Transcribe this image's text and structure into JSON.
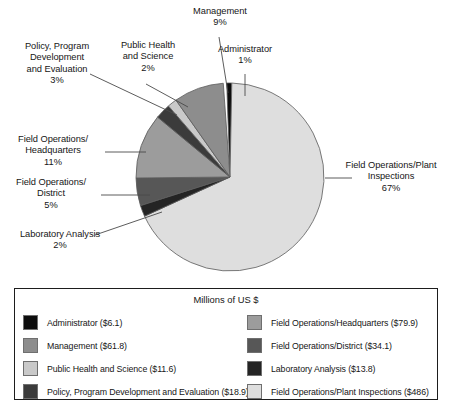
{
  "chart_data": {
    "type": "pie",
    "title": "",
    "legend_title": "Millions of US $",
    "legend_position": "bottom",
    "unit": "Millions of US $",
    "total_value": 716.2,
    "categories": [
      "Administrator",
      "Field Operations/Plant Inspections",
      "Laboratory Analysis",
      "Field Operations/District",
      "Field Operations/Headquarters",
      "Policy, Program Development and Evaluation",
      "Public Health and Science",
      "Management"
    ],
    "values": [
      6.1,
      486,
      13.8,
      34.1,
      79.9,
      18.9,
      11.6,
      61.8
    ],
    "percentages": [
      1,
      67,
      2,
      5,
      11,
      3,
      2,
      9
    ],
    "colors": [
      "#0d0d0d",
      "#dedede",
      "#242424",
      "#575757",
      "#9c9c9c",
      "#3b3b3b",
      "#c9c9c9",
      "#8d8d8d"
    ],
    "slices": [
      {
        "name": "Administrator",
        "value": 6.1,
        "percent": 1,
        "color": "#0d0d0d",
        "start_angle": -2.0,
        "sweep": 3.1
      },
      {
        "name": "Field Operations/Plant Inspections",
        "value": 486,
        "percent": 67,
        "color": "#dedede",
        "start_angle": 1.1,
        "sweep": 244.3
      },
      {
        "name": "Laboratory Analysis",
        "value": 13.8,
        "percent": 2,
        "color": "#242424",
        "start_angle": 245.4,
        "sweep": 6.9
      },
      {
        "name": "Field Operations/District",
        "value": 34.1,
        "percent": 5,
        "color": "#575757",
        "start_angle": 252.3,
        "sweep": 17.1
      },
      {
        "name": "Field Operations/Headquarters",
        "value": 79.9,
        "percent": 11,
        "color": "#9c9c9c",
        "start_angle": 269.4,
        "sweep": 40.2
      },
      {
        "name": "Policy, Program Development and Evaluation",
        "value": 18.9,
        "percent": 3,
        "color": "#3b3b3b",
        "start_angle": 309.6,
        "sweep": 9.5
      },
      {
        "name": "Public Health and Science",
        "value": 11.6,
        "percent": 2,
        "color": "#c9c9c9",
        "start_angle": 319.1,
        "sweep": 5.8
      },
      {
        "name": "Management",
        "value": 61.8,
        "percent": 9,
        "color": "#8d8d8d",
        "start_angle": 324.9,
        "sweep": 31.0
      }
    ]
  },
  "labels": {
    "management": "Management\n9%",
    "public_health": "Public Health\nand Science\n2%",
    "administrator": "Administrator\n1%",
    "policy": "Policy, Program\nDevelopment\nand Evaluation\n3%",
    "headquarters": "Field Operations/\nHeadquarters\n11%",
    "district": "Field Operations/\nDistrict\n5%",
    "laboratory": "Laboratory Analysis\n2%",
    "plant_inspections": "Field Operations/Plant\nInspections\n67%"
  },
  "legend": {
    "title": "Millions of US $",
    "left_column": [
      {
        "label": "Administrator ($6.1)",
        "color": "#0d0d0d"
      },
      {
        "label": "Management ($61.8)",
        "color": "#8d8d8d"
      },
      {
        "label": "Public Health and Science ($11.6)",
        "color": "#c9c9c9"
      },
      {
        "label": "Policy, Program Development and Evaluation ($18.9)",
        "color": "#3b3b3b"
      }
    ],
    "right_column": [
      {
        "label": "Field Operations/Headquarters ($79.9)",
        "color": "#9c9c9c"
      },
      {
        "label": "Field Operations/District ($34.1)",
        "color": "#575757"
      },
      {
        "label": "Laboratory Analysis  ($13.8)",
        "color": "#242424"
      },
      {
        "label": "Field Operations/Plant Inspections ($486)",
        "color": "#dedede"
      }
    ]
  }
}
